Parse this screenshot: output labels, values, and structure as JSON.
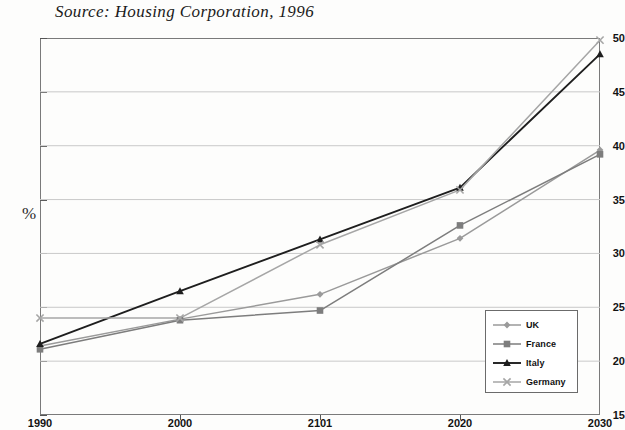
{
  "caption": {
    "source_text": "Source: Housing Corporation, 1996"
  },
  "axis": {
    "y_label": "%",
    "y_ticks": [
      "50",
      "45",
      "40",
      "35",
      "30",
      "25",
      "20",
      "15"
    ],
    "x_ticks": [
      "1990",
      "2000",
      "2101",
      "2020",
      "2030"
    ]
  },
  "legend": {
    "items": [
      {
        "label": "UK",
        "marker": "diamond-marker",
        "color": "#9a9a9a"
      },
      {
        "label": "France",
        "marker": "square-marker",
        "color": "#7d7d7d"
      },
      {
        "label": "Italy",
        "marker": "triangle-marker",
        "color": "#1e1e1e"
      },
      {
        "label": "Germany",
        "marker": "cross-marker",
        "color": "#a6a6a6"
      }
    ]
  },
  "chart_data": {
    "type": "line",
    "title": "",
    "subtitle": "",
    "xlabel": "",
    "ylabel": "%",
    "categories": [
      "1990",
      "2000",
      "2101",
      "2020",
      "2030"
    ],
    "x": [
      1990,
      2000,
      2101,
      2020,
      2030
    ],
    "ylim": [
      15,
      50
    ],
    "yticks": [
      15,
      20,
      25,
      30,
      35,
      40,
      45,
      50
    ],
    "grid": "horizontal",
    "legend_position": "inside-bottom-right",
    "annotations": [
      "Source: Housing Corporation, 1996"
    ],
    "series": [
      {
        "name": "UK",
        "marker": "diamond",
        "color": "#9a9a9a",
        "values": [
          21.4,
          23.9,
          26.2,
          31.4,
          39.6
        ]
      },
      {
        "name": "France",
        "marker": "square",
        "color": "#7d7d7d",
        "values": [
          21.1,
          23.8,
          24.7,
          32.6,
          39.2
        ]
      },
      {
        "name": "Italy",
        "marker": "triangle",
        "color": "#1e1e1e",
        "values": [
          21.6,
          26.5,
          31.3,
          36.1,
          48.5
        ]
      },
      {
        "name": "Germany",
        "marker": "cross",
        "color": "#a6a6a6",
        "values": [
          24.0,
          24.0,
          30.8,
          35.9,
          49.8
        ]
      }
    ]
  }
}
